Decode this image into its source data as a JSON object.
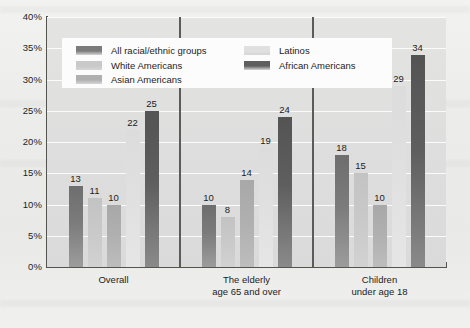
{
  "chart_data": {
    "type": "bar",
    "title": "",
    "xlabel": "",
    "ylabel": "Percentage",
    "ylim": [
      0,
      40
    ],
    "ytick_labels": [
      "40%",
      "35%",
      "30%",
      "25%",
      "20%",
      "15%",
      "10%",
      "5%",
      "0%"
    ],
    "ytick_values": [
      40,
      35,
      30,
      25,
      20,
      15,
      10,
      5,
      0
    ],
    "grid": true,
    "legend_position": "top-inside",
    "categories": [
      "Overall",
      "The elderly age 65 and over",
      "Children under age 18"
    ],
    "category_lines": [
      [
        "Overall"
      ],
      [
        "The elderly",
        "age 65 and over"
      ],
      [
        "Children",
        "under age 18"
      ]
    ],
    "series": [
      {
        "name": "All racial/ethnic groups",
        "color": "#7b7b7b",
        "values": [
          13,
          10,
          18
        ]
      },
      {
        "name": "White Americans",
        "color": "#c9c9c9",
        "values": [
          11,
          8,
          15
        ]
      },
      {
        "name": "Asian Americans",
        "color": "#b0b0b0",
        "values": [
          10,
          14,
          10
        ]
      },
      {
        "name": "Latinos",
        "color": "#e0e0e0",
        "values": [
          22,
          19,
          29
        ]
      },
      {
        "name": "African Americans",
        "color": "#5e5e5e",
        "values": [
          25,
          24,
          34
        ]
      }
    ]
  },
  "legend": {
    "left_column": [
      "All racial/ethnic groups",
      "White Americans",
      "Asian Americans"
    ],
    "right_column": [
      "Latinos",
      "African Americans"
    ]
  }
}
